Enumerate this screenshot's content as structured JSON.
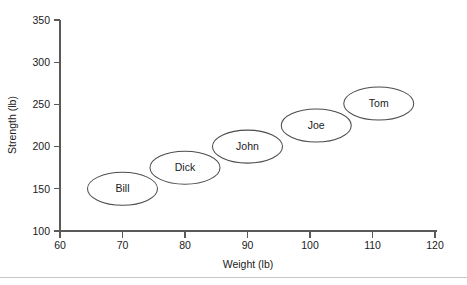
{
  "chart_data": {
    "type": "scatter",
    "title": "",
    "xlabel": "Weight (lb)",
    "ylabel": "Strength (lb)",
    "xlim": [
      60,
      120
    ],
    "ylim": [
      100,
      350
    ],
    "xticks": [
      60,
      70,
      80,
      90,
      100,
      110,
      120
    ],
    "yticks": [
      100,
      150,
      200,
      250,
      300,
      350
    ],
    "xtick_labels": [
      "60",
      "70",
      "80",
      "90",
      "100",
      "110",
      "120"
    ],
    "ytick_labels": [
      "100",
      "150",
      "200",
      "250",
      "300",
      "350"
    ],
    "grid": false,
    "legend": "none",
    "marker_style": "labeled-ellipse",
    "points": [
      {
        "label": "Bill",
        "x": 70,
        "y": 150
      },
      {
        "label": "Dick",
        "x": 80,
        "y": 175
      },
      {
        "label": "John",
        "x": 90,
        "y": 200
      },
      {
        "label": "Joe",
        "x": 101,
        "y": 225
      },
      {
        "label": "Tom",
        "x": 111,
        "y": 251
      }
    ]
  },
  "figure": {
    "background_color": "#ffffff",
    "axis_color": "#5a5a5a",
    "marker_fill": "#ffffff",
    "marker_stroke": "#4d4d4d",
    "text_color": "#1a1a1a",
    "footer_rule_color": "#c8c8c8"
  }
}
